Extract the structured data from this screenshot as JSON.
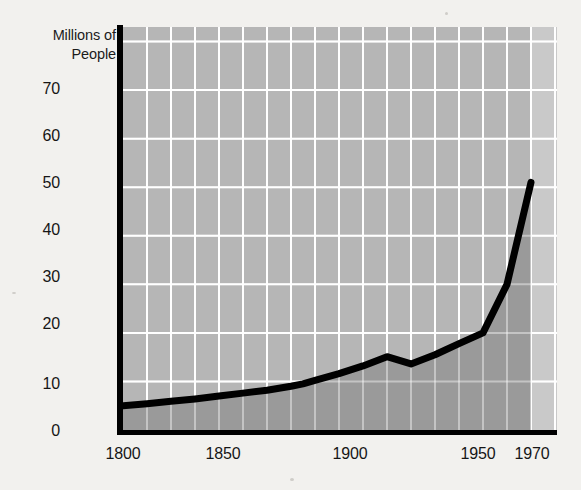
{
  "chart_data": {
    "type": "area",
    "title": "",
    "ylabel": "Millions of\nPeople",
    "xlabel": "",
    "ylim": [
      0,
      83
    ],
    "xlim": [
      1800,
      1970
    ],
    "grid": true,
    "grid_x_interval": 10,
    "grid_y_interval": 10,
    "legend": "none",
    "y_ticks": [
      {
        "value": 70,
        "label": "70"
      },
      {
        "value": 60,
        "label": "60"
      },
      {
        "value": 50,
        "label": "50"
      },
      {
        "value": 40,
        "label": "40"
      },
      {
        "value": 30,
        "label": "30"
      },
      {
        "value": 20,
        "label": "20"
      },
      {
        "value": 10,
        "label": "10"
      },
      {
        "value": 0,
        "label": "0"
      }
    ],
    "x_ticks": [
      {
        "value": 1800,
        "label": "1800"
      },
      {
        "value": 1850,
        "label": "1850"
      },
      {
        "value": 1900,
        "label": "1900"
      },
      {
        "value": 1950,
        "label": "1950"
      },
      {
        "value": 1970,
        "label": "1970"
      }
    ],
    "series": [
      {
        "name": "Population",
        "x": [
          1800,
          1810,
          1820,
          1830,
          1840,
          1850,
          1860,
          1870,
          1875,
          1880,
          1890,
          1900,
          1910,
          1920,
          1930,
          1940,
          1950,
          1960,
          1970
        ],
        "values": [
          5.0,
          5.4,
          5.9,
          6.4,
          7.0,
          7.6,
          8.2,
          9.0,
          9.5,
          10.2,
          11.6,
          13.2,
          15.1,
          13.6,
          15.5,
          17.8,
          20.0,
          30.0,
          51.0
        ]
      }
    ],
    "annotations": []
  },
  "style": {
    "page_background": "#f2f1ee",
    "plot_background": "#b6b6b6",
    "fill_below_curve": "#9a9a9a",
    "post_1970_band": "#c9c9c9",
    "grid_color": "#ffffff",
    "line_color": "#000000",
    "axis_color": "#000000",
    "text_color": "#161616"
  }
}
